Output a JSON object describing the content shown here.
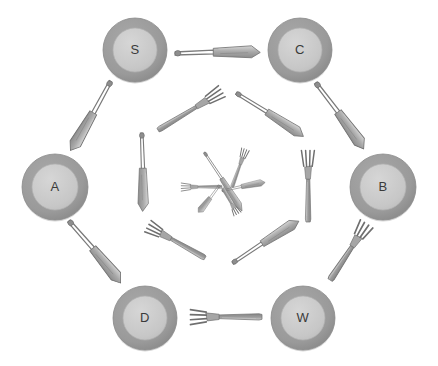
{
  "diagram": {
    "type": "radial-nested-arrangement",
    "background_color": "#ffffff",
    "palette": {
      "plate_rim": "#9a9a9a",
      "plate_inner": "#c9c9c9",
      "plate_rim_shadow": "#8a8a8a",
      "label_color": "#3a3a3a",
      "cutlery_dark": "#7d7d7d",
      "cutlery_mid": "#a0a0a0",
      "cutlery_light": "#c4c4c4",
      "cutlery_outline": "#6e6e6e"
    },
    "rings": [
      {
        "name": "outer-plate-ring",
        "count": 6,
        "contents": "plates"
      },
      {
        "name": "outer-cutlery-ring",
        "count": 6,
        "contents": "knives-and-forks"
      },
      {
        "name": "middle-cutlery-ring",
        "count": 6,
        "contents": "knives-and-forks"
      },
      {
        "name": "inner-cutlery-ring",
        "count": 6,
        "contents": "small-knives-and-forks"
      }
    ]
  },
  "plates": [
    {
      "id": "plate-s",
      "label": "S",
      "cx": 135,
      "cy": 50,
      "r_outer": 32,
      "r_inner": 22,
      "position": "top-left"
    },
    {
      "id": "plate-c",
      "label": "C",
      "cx": 300,
      "cy": 50,
      "r_outer": 32,
      "r_inner": 22,
      "position": "top-right"
    },
    {
      "id": "plate-a",
      "label": "A",
      "cx": 55,
      "cy": 187,
      "r_outer": 33,
      "r_inner": 23,
      "position": "left"
    },
    {
      "id": "plate-b",
      "label": "B",
      "cx": 383,
      "cy": 187,
      "r_outer": 33,
      "r_inner": 23,
      "position": "right"
    },
    {
      "id": "plate-d",
      "label": "D",
      "cx": 145,
      "cy": 318,
      "r_outer": 32,
      "r_inner": 22,
      "position": "bottom-left"
    },
    {
      "id": "plate-w",
      "label": "W",
      "cx": 303,
      "cy": 318,
      "r_outer": 32,
      "r_inner": 22,
      "position": "bottom-right"
    }
  ],
  "outer_cutlery": [
    {
      "id": "knife-s-c",
      "kind": "knife",
      "x1": 175,
      "y1": 52,
      "x2": 262,
      "y2": 52,
      "tip_at": "end",
      "between": "S-C"
    },
    {
      "id": "knife-c-b",
      "kind": "knife",
      "x1": 317,
      "y1": 82,
      "x2": 365,
      "y2": 150,
      "tip_at": "end",
      "between": "C-B"
    },
    {
      "id": "fork-b-w",
      "kind": "fork",
      "x1": 330,
      "y1": 280,
      "x2": 368,
      "y2": 222,
      "tip_at": "end",
      "between": "B-W"
    },
    {
      "id": "fork-d-w",
      "kind": "fork",
      "x1": 188,
      "y1": 317,
      "x2": 262,
      "y2": 317,
      "tip_at": "start",
      "between": "D-W"
    },
    {
      "id": "knife-a-d",
      "kind": "knife",
      "x1": 70,
      "y1": 220,
      "x2": 122,
      "y2": 284,
      "tip_at": "end",
      "between": "A-D"
    },
    {
      "id": "knife-s-a",
      "kind": "knife",
      "x1": 112,
      "y1": 82,
      "x2": 70,
      "y2": 152,
      "tip_at": "end",
      "between": "S-A"
    }
  ],
  "middle_cutlery": [
    {
      "id": "fork-mid-top-left",
      "kind": "fork",
      "x1": 158,
      "y1": 130,
      "x2": 224,
      "y2": 90,
      "tip_at": "end"
    },
    {
      "id": "knife-mid-top-right",
      "kind": "knife",
      "x1": 237,
      "y1": 92,
      "x2": 305,
      "y2": 137,
      "tip_at": "end"
    },
    {
      "id": "fork-mid-right",
      "kind": "fork",
      "x1": 308,
      "y1": 222,
      "x2": 308,
      "y2": 148,
      "tip_at": "end"
    },
    {
      "id": "knife-mid-bottom-right",
      "kind": "knife",
      "x1": 232,
      "y1": 262,
      "x2": 300,
      "y2": 220,
      "tip_at": "end"
    },
    {
      "id": "fork-mid-bottom-left",
      "kind": "fork",
      "x1": 205,
      "y1": 258,
      "x2": 146,
      "y2": 225,
      "tip_at": "end"
    },
    {
      "id": "knife-mid-left",
      "kind": "knife",
      "x1": 143,
      "y1": 133,
      "x2": 143,
      "y2": 213,
      "tip_at": "end"
    }
  ],
  "inner_cutlery": [
    {
      "id": "fork-core-top-right",
      "kind": "fork",
      "x1": 232,
      "y1": 187,
      "x2": 246,
      "y2": 148,
      "tip_at": "end"
    },
    {
      "id": "knife-core-diagonal",
      "kind": "knife",
      "x1": 205,
      "y1": 152,
      "x2": 243,
      "y2": 212,
      "tip_at": "end"
    },
    {
      "id": "fork-core-left",
      "kind": "fork",
      "x1": 222,
      "y1": 187,
      "x2": 180,
      "y2": 187,
      "tip_at": "end"
    },
    {
      "id": "knife-core-right",
      "kind": "knife",
      "x1": 222,
      "y1": 190,
      "x2": 266,
      "y2": 182,
      "tip_at": "end"
    },
    {
      "id": "fork-core-bottom",
      "kind": "fork",
      "x1": 223,
      "y1": 188,
      "x2": 238,
      "y2": 215,
      "tip_at": "end"
    },
    {
      "id": "knife-core-bottom-left",
      "kind": "knife",
      "x1": 220,
      "y1": 186,
      "x2": 198,
      "y2": 213,
      "tip_at": "end"
    }
  ]
}
